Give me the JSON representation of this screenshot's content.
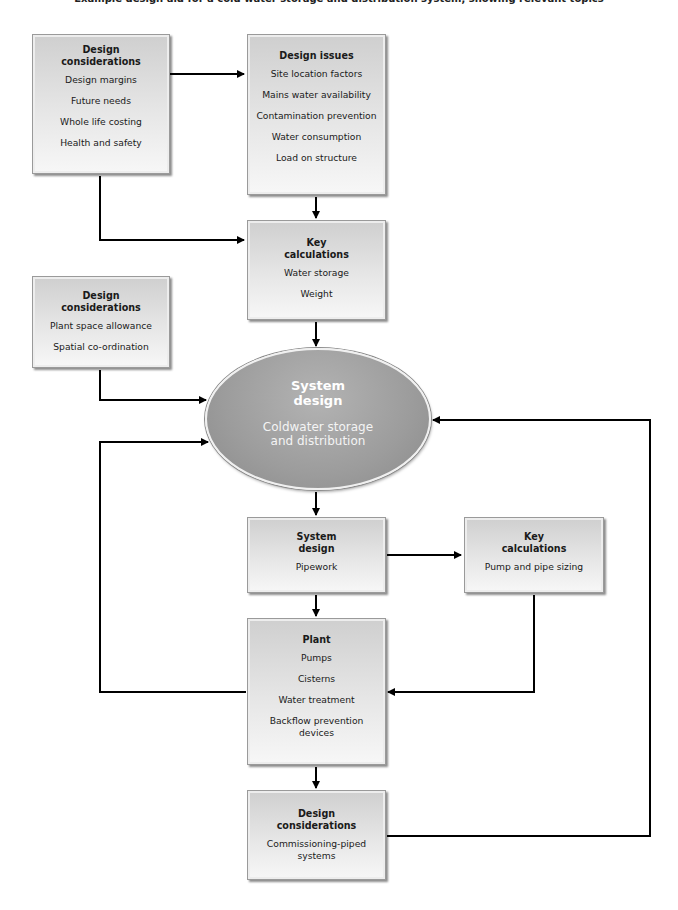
{
  "caption": "Example design aid for a cold water storage and distribution system, showing relevant topics",
  "nodes": {
    "design_considerations_1": {
      "title": "Design\nconsiderations",
      "items": [
        "Design margins",
        "Future needs",
        "Whole life costing",
        "Health and safety"
      ]
    },
    "design_issues": {
      "title": "Design issues",
      "items": [
        "Site location factors",
        "Mains water availability",
        "Contamination prevention",
        "Water consumption",
        "Load on structure"
      ]
    },
    "key_calculations_1": {
      "title": "Key\ncalculations",
      "items": [
        "Water storage",
        "Weight"
      ]
    },
    "design_considerations_2": {
      "title": "Design\nconsiderations",
      "items": [
        "Plant space allowance",
        "Spatial co-ordination"
      ]
    },
    "system_design_core": {
      "title": "System\ndesign",
      "subtitle": "Coldwater storage\nand distribution"
    },
    "system_design_pipework": {
      "title": "System\ndesign",
      "items": [
        "Pipework"
      ]
    },
    "key_calculations_2": {
      "title": "Key\ncalculations",
      "items": [
        "Pump and pipe sizing"
      ]
    },
    "plant": {
      "title": "Plant",
      "items": [
        "Pumps",
        "Cisterns",
        "Water treatment",
        "Backflow prevention\ndevices"
      ]
    },
    "design_considerations_3": {
      "title": "Design\nconsiderations",
      "items": [
        "Commissioning-piped\nsystems"
      ]
    }
  },
  "edges": [
    {
      "from": "design_considerations_1",
      "to": "design_issues"
    },
    {
      "from": "design_considerations_1",
      "to": "key_calculations_1"
    },
    {
      "from": "design_issues",
      "to": "key_calculations_1"
    },
    {
      "from": "key_calculations_1",
      "to": "system_design_core"
    },
    {
      "from": "design_considerations_2",
      "to": "system_design_core"
    },
    {
      "from": "system_design_core",
      "to": "system_design_pipework"
    },
    {
      "from": "system_design_pipework",
      "to": "key_calculations_2"
    },
    {
      "from": "system_design_pipework",
      "to": "plant"
    },
    {
      "from": "key_calculations_2",
      "to": "plant"
    },
    {
      "from": "plant",
      "to": "system_design_core",
      "note": "feedback loop (left)"
    },
    {
      "from": "plant",
      "to": "design_considerations_3"
    },
    {
      "from": "design_considerations_3",
      "to": "system_design_core",
      "note": "feedback loop (right)"
    }
  ]
}
